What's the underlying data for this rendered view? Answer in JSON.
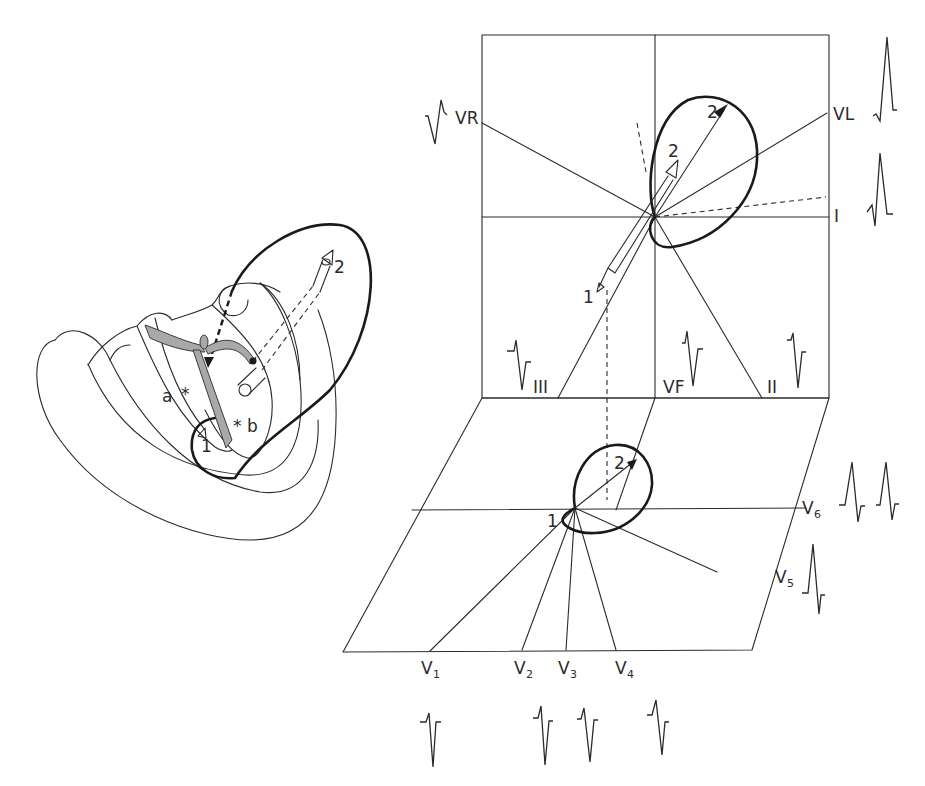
{
  "figure": {
    "heart_panel": {
      "labels": {
        "a": "a",
        "b": "b",
        "vector1": "1",
        "vector2": "2"
      }
    },
    "frontal_plane": {
      "leads": [
        {
          "id": "VR",
          "label": "VR"
        },
        {
          "id": "VL",
          "label": "VL"
        },
        {
          "id": "I",
          "label": "I"
        },
        {
          "id": "II",
          "label": "II"
        },
        {
          "id": "III",
          "label": "III"
        },
        {
          "id": "VF",
          "label": "VF"
        }
      ],
      "vector_labels": {
        "v1": "1",
        "v2_arrow": "2",
        "v2_loop": "2"
      }
    },
    "horizontal_plane": {
      "leads": [
        {
          "id": "V1",
          "base": "V",
          "sub": "1"
        },
        {
          "id": "V2",
          "base": "V",
          "sub": "2"
        },
        {
          "id": "V3",
          "base": "V",
          "sub": "3"
        },
        {
          "id": "V4",
          "base": "V",
          "sub": "4"
        },
        {
          "id": "V5",
          "base": "V",
          "sub": "5"
        },
        {
          "id": "V6",
          "base": "V",
          "sub": "6"
        }
      ],
      "vector_labels": {
        "v1": "1",
        "v2": "2"
      }
    },
    "colors": {
      "line": "#2b2b2b",
      "loop": "#1a1a1a",
      "conduction": "#a9a9a9",
      "background": "#ffffff"
    }
  }
}
